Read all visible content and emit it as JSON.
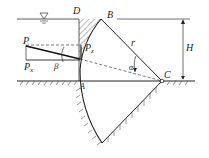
{
  "diagram": {
    "type": "radial gate (tainter gate) hydrostatic force diagram",
    "labels": {
      "D": "D",
      "B": "B",
      "A": "A",
      "C": "C",
      "P": "P",
      "Px": "P",
      "Px_sub": "x",
      "Pz": "P",
      "Pz_sub": "z",
      "r": "r",
      "H": "H",
      "alpha": "α",
      "beta": "β",
      "water_surface": "∇"
    },
    "colors": {
      "line": "#222222",
      "background": "#ffffff"
    }
  }
}
